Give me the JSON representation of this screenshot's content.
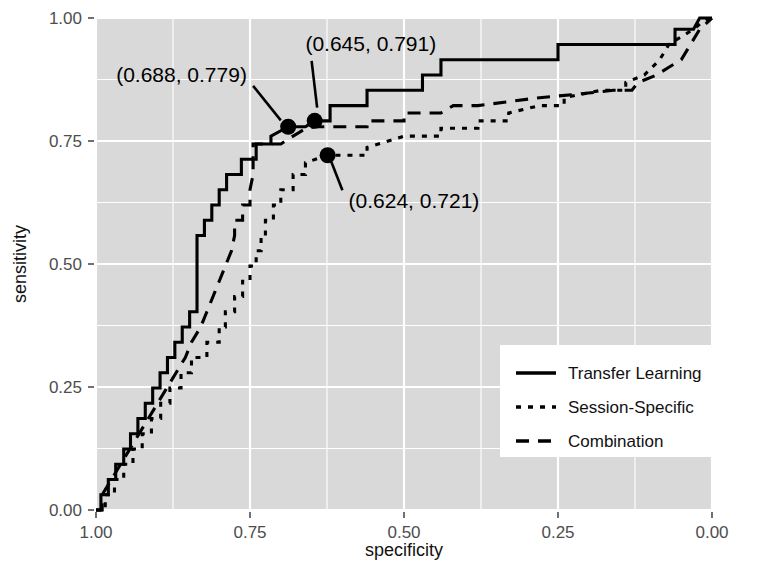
{
  "chart_data": {
    "type": "line",
    "title": "",
    "xlabel": "specificity",
    "ylabel": "sensitivity",
    "xlim": [
      1.0,
      0.0
    ],
    "ylim": [
      0.0,
      1.0
    ],
    "x_reversed": true,
    "grid": true,
    "grid_color": "#ffffff",
    "panel_background": "#d9d9d9",
    "line_color": "#000000",
    "legend_position": "bottom-right",
    "xticks": [
      "1.00",
      "0.75",
      "0.50",
      "0.25",
      "0.00"
    ],
    "xtick_values": [
      1.0,
      0.75,
      0.5,
      0.25,
      0.0
    ],
    "yticks": [
      "0.00",
      "0.25",
      "0.50",
      "0.75",
      "1.00"
    ],
    "ytick_values": [
      0.0,
      0.25,
      0.5,
      0.75,
      1.0
    ],
    "series": [
      {
        "name": "Transfer Learning",
        "style": "solid",
        "points": [
          [
            1.0,
            0.0
          ],
          [
            0.992,
            0.0
          ],
          [
            0.992,
            0.031
          ],
          [
            0.98,
            0.031
          ],
          [
            0.98,
            0.062
          ],
          [
            0.968,
            0.062
          ],
          [
            0.968,
            0.093
          ],
          [
            0.955,
            0.093
          ],
          [
            0.955,
            0.124
          ],
          [
            0.944,
            0.124
          ],
          [
            0.944,
            0.155
          ],
          [
            0.932,
            0.155
          ],
          [
            0.932,
            0.186
          ],
          [
            0.92,
            0.186
          ],
          [
            0.92,
            0.217
          ],
          [
            0.908,
            0.217
          ],
          [
            0.908,
            0.248
          ],
          [
            0.896,
            0.248
          ],
          [
            0.896,
            0.279
          ],
          [
            0.884,
            0.279
          ],
          [
            0.884,
            0.31
          ],
          [
            0.872,
            0.31
          ],
          [
            0.872,
            0.341
          ],
          [
            0.86,
            0.341
          ],
          [
            0.86,
            0.372
          ],
          [
            0.848,
            0.372
          ],
          [
            0.848,
            0.403
          ],
          [
            0.836,
            0.403
          ],
          [
            0.836,
            0.434
          ],
          [
            0.836,
            0.465
          ],
          [
            0.836,
            0.496
          ],
          [
            0.836,
            0.527
          ],
          [
            0.836,
            0.558
          ],
          [
            0.824,
            0.558
          ],
          [
            0.824,
            0.589
          ],
          [
            0.812,
            0.589
          ],
          [
            0.812,
            0.62
          ],
          [
            0.8,
            0.62
          ],
          [
            0.8,
            0.651
          ],
          [
            0.788,
            0.651
          ],
          [
            0.788,
            0.682
          ],
          [
            0.764,
            0.682
          ],
          [
            0.764,
            0.713
          ],
          [
            0.74,
            0.713
          ],
          [
            0.74,
            0.744
          ],
          [
            0.716,
            0.744
          ],
          [
            0.716,
            0.76
          ],
          [
            0.688,
            0.779
          ],
          [
            0.66,
            0.779
          ],
          [
            0.645,
            0.791
          ],
          [
            0.62,
            0.791
          ],
          [
            0.62,
            0.822
          ],
          [
            0.56,
            0.822
          ],
          [
            0.56,
            0.853
          ],
          [
            0.47,
            0.853
          ],
          [
            0.47,
            0.884
          ],
          [
            0.44,
            0.884
          ],
          [
            0.44,
            0.915
          ],
          [
            0.25,
            0.915
          ],
          [
            0.25,
            0.946
          ],
          [
            0.1,
            0.946
          ],
          [
            0.06,
            0.946
          ],
          [
            0.06,
            0.977
          ],
          [
            0.03,
            0.977
          ],
          [
            0.02,
            1.0
          ],
          [
            0.0,
            1.0
          ]
        ]
      },
      {
        "name": "Session-Specific",
        "style": "dotted",
        "points": [
          [
            1.0,
            0.0
          ],
          [
            0.985,
            0.0
          ],
          [
            0.985,
            0.031
          ],
          [
            0.97,
            0.031
          ],
          [
            0.97,
            0.062
          ],
          [
            0.955,
            0.062
          ],
          [
            0.955,
            0.093
          ],
          [
            0.94,
            0.093
          ],
          [
            0.94,
            0.124
          ],
          [
            0.925,
            0.124
          ],
          [
            0.925,
            0.155
          ],
          [
            0.91,
            0.155
          ],
          [
            0.91,
            0.186
          ],
          [
            0.895,
            0.186
          ],
          [
            0.895,
            0.217
          ],
          [
            0.88,
            0.217
          ],
          [
            0.88,
            0.248
          ],
          [
            0.862,
            0.248
          ],
          [
            0.862,
            0.279
          ],
          [
            0.845,
            0.279
          ],
          [
            0.845,
            0.31
          ],
          [
            0.82,
            0.31
          ],
          [
            0.82,
            0.341
          ],
          [
            0.8,
            0.341
          ],
          [
            0.8,
            0.372
          ],
          [
            0.79,
            0.372
          ],
          [
            0.79,
            0.403
          ],
          [
            0.775,
            0.403
          ],
          [
            0.775,
            0.434
          ],
          [
            0.762,
            0.434
          ],
          [
            0.762,
            0.465
          ],
          [
            0.75,
            0.465
          ],
          [
            0.75,
            0.496
          ],
          [
            0.74,
            0.496
          ],
          [
            0.74,
            0.527
          ],
          [
            0.732,
            0.527
          ],
          [
            0.732,
            0.558
          ],
          [
            0.725,
            0.558
          ],
          [
            0.725,
            0.589
          ],
          [
            0.712,
            0.589
          ],
          [
            0.712,
            0.62
          ],
          [
            0.7,
            0.62
          ],
          [
            0.7,
            0.651
          ],
          [
            0.68,
            0.651
          ],
          [
            0.68,
            0.682
          ],
          [
            0.66,
            0.682
          ],
          [
            0.66,
            0.706
          ],
          [
            0.624,
            0.721
          ],
          [
            0.56,
            0.721
          ],
          [
            0.56,
            0.737
          ],
          [
            0.52,
            0.752
          ],
          [
            0.5,
            0.76
          ],
          [
            0.44,
            0.76
          ],
          [
            0.44,
            0.776
          ],
          [
            0.38,
            0.776
          ],
          [
            0.38,
            0.791
          ],
          [
            0.33,
            0.791
          ],
          [
            0.33,
            0.807
          ],
          [
            0.28,
            0.822
          ],
          [
            0.24,
            0.822
          ],
          [
            0.24,
            0.838
          ],
          [
            0.18,
            0.853
          ],
          [
            0.14,
            0.853
          ],
          [
            0.14,
            0.869
          ],
          [
            0.11,
            0.884
          ],
          [
            0.085,
            0.915
          ],
          [
            0.07,
            0.946
          ],
          [
            0.05,
            0.962
          ],
          [
            0.03,
            0.977
          ],
          [
            0.015,
            0.993
          ],
          [
            0.0,
            1.0
          ]
        ]
      },
      {
        "name": "Combination",
        "style": "dashed",
        "points": [
          [
            1.0,
            0.0
          ],
          [
            0.99,
            0.0
          ],
          [
            0.99,
            0.031
          ],
          [
            0.975,
            0.062
          ],
          [
            0.96,
            0.093
          ],
          [
            0.945,
            0.124
          ],
          [
            0.93,
            0.155
          ],
          [
            0.915,
            0.186
          ],
          [
            0.9,
            0.217
          ],
          [
            0.885,
            0.248
          ],
          [
            0.87,
            0.279
          ],
          [
            0.855,
            0.31
          ],
          [
            0.845,
            0.341
          ],
          [
            0.83,
            0.372
          ],
          [
            0.82,
            0.403
          ],
          [
            0.81,
            0.434
          ],
          [
            0.8,
            0.465
          ],
          [
            0.79,
            0.496
          ],
          [
            0.78,
            0.527
          ],
          [
            0.775,
            0.558
          ],
          [
            0.775,
            0.589
          ],
          [
            0.762,
            0.589
          ],
          [
            0.762,
            0.62
          ],
          [
            0.75,
            0.62
          ],
          [
            0.75,
            0.651
          ],
          [
            0.745,
            0.682
          ],
          [
            0.745,
            0.713
          ],
          [
            0.745,
            0.744
          ],
          [
            0.7,
            0.744
          ],
          [
            0.68,
            0.76
          ],
          [
            0.66,
            0.775
          ],
          [
            0.645,
            0.779
          ],
          [
            0.61,
            0.779
          ],
          [
            0.56,
            0.779
          ],
          [
            0.56,
            0.791
          ],
          [
            0.5,
            0.791
          ],
          [
            0.5,
            0.807
          ],
          [
            0.44,
            0.807
          ],
          [
            0.42,
            0.822
          ],
          [
            0.38,
            0.822
          ],
          [
            0.33,
            0.83
          ],
          [
            0.28,
            0.838
          ],
          [
            0.22,
            0.845
          ],
          [
            0.16,
            0.853
          ],
          [
            0.13,
            0.853
          ],
          [
            0.12,
            0.869
          ],
          [
            0.09,
            0.884
          ],
          [
            0.07,
            0.9
          ],
          [
            0.05,
            0.915
          ],
          [
            0.035,
            0.946
          ],
          [
            0.02,
            0.977
          ],
          [
            0.0,
            1.0
          ]
        ]
      }
    ],
    "annotations": [
      {
        "label": "(0.688, 0.779)",
        "point": [
          0.688,
          0.779
        ],
        "text_anchor": "end",
        "text_x": 0.755,
        "text_y": 0.885,
        "leader_from": [
          0.745,
          0.862
        ],
        "leader_to": [
          0.7,
          0.792
        ]
      },
      {
        "label": "(0.645, 0.791)",
        "point": [
          0.645,
          0.791
        ],
        "text_anchor": "start",
        "text_x": 0.66,
        "text_y": 0.948,
        "leader_from": [
          0.65,
          0.913
        ],
        "leader_to": [
          0.641,
          0.818
        ]
      },
      {
        "label": "(0.624, 0.721)",
        "point": [
          0.624,
          0.721
        ],
        "text_anchor": "start",
        "text_x": 0.59,
        "text_y": 0.628,
        "leader_from": [
          0.6,
          0.65
        ],
        "leader_to": [
          0.618,
          0.708
        ]
      }
    ],
    "legend": {
      "entries": [
        {
          "label": "Transfer Learning",
          "style": "solid"
        },
        {
          "label": "Session-Specific",
          "style": "dotted"
        },
        {
          "label": "Combination",
          "style": "dashed"
        }
      ]
    }
  }
}
